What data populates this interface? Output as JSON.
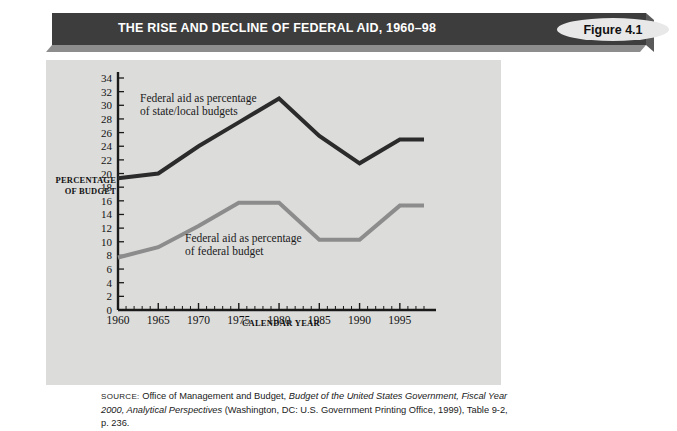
{
  "banner": {
    "title": "THE RISE AND DECLINE OF FEDERAL AID, 1960–98",
    "figure_label": "Figure 4.1",
    "bar_color": "#3d3d3d",
    "label_bg": "#e8e8e8"
  },
  "panel": {
    "background": "#dcdcda"
  },
  "source": {
    "prefix": "SOURCE:",
    "text_1": " Office of Management and Budget, ",
    "italic_1": "Budget of the United States Government, Fiscal Year 2000, Analytical Perspectives",
    "text_2": " (Washington, DC: U.S. Government Printing Office, 1999), Table 9-2, p. 236."
  },
  "chart_data": {
    "type": "line",
    "title": "THE RISE AND DECLINE OF FEDERAL AID, 1960–98",
    "xlabel": "CALENDAR YEAR",
    "ylabel": "PERCENTAGE OF BUDGET",
    "ylabel_line1": "PERCENTAGE",
    "ylabel_line2": "OF BUDGET",
    "grid": false,
    "legend": "annotations-inline",
    "xlim": [
      1960,
      1998
    ],
    "ylim": [
      0,
      34
    ],
    "ytick_labels": [
      "0",
      "2",
      "4",
      "6",
      "8",
      "10",
      "12",
      "14",
      "16",
      "18",
      "20",
      "22",
      "24",
      "26",
      "28",
      "30",
      "32",
      "34"
    ],
    "yticks": [
      0,
      2,
      4,
      6,
      8,
      10,
      12,
      14,
      16,
      18,
      20,
      22,
      24,
      26,
      28,
      30,
      32,
      34
    ],
    "xtick_labels": [
      "1960",
      "1965",
      "1970",
      "1975",
      "1980",
      "1985",
      "1990",
      "1995"
    ],
    "xticks": [
      1960,
      1965,
      1970,
      1975,
      1980,
      1985,
      1990,
      1995
    ],
    "x": [
      1960,
      1965,
      1970,
      1975,
      1980,
      1985,
      1990,
      1995,
      1998
    ],
    "series": [
      {
        "name": "Federal aid as percentage of state/local budgets",
        "annotation_line1": "Federal aid as percentage",
        "annotation_line2": "of state/local budgets",
        "color": "#2b2b2b",
        "values": [
          19.3,
          20.0,
          24.0,
          27.5,
          31.0,
          25.5,
          21.5,
          25.0,
          25.0
        ]
      },
      {
        "name": "Federal aid as percentage of federal budget",
        "annotation_line1": "Federal aid as percentage",
        "annotation_line2": "of federal budget",
        "color": "#8c8c8c",
        "values": [
          7.7,
          9.2,
          12.3,
          15.7,
          15.7,
          10.3,
          10.3,
          15.3,
          15.3
        ]
      }
    ]
  }
}
